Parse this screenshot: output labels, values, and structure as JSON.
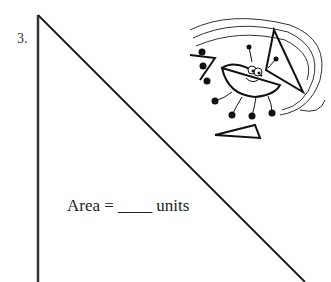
{
  "problem": {
    "number": "3.",
    "area_label": "Area = ____ units"
  },
  "figure": {
    "shape": "right-triangle",
    "icon": "bug-character-clipart"
  }
}
